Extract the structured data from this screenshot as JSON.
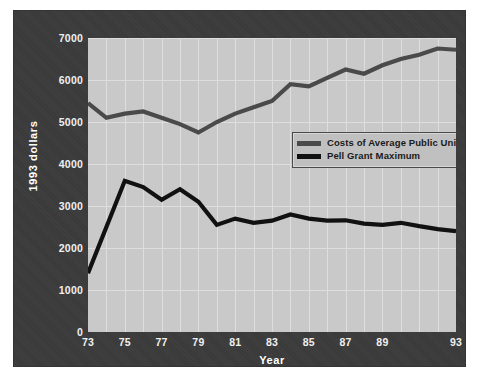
{
  "chart_data": {
    "type": "line",
    "title": "",
    "xlabel": "Year",
    "ylabel": "1993 dollars",
    "grid": true,
    "legend_position": "inside-upper-right",
    "xlim": [
      1973,
      1993
    ],
    "ylim": [
      0,
      7000
    ],
    "ytick_labels": [
      "7000",
      "6000",
      "5000",
      "4000",
      "3000",
      "2000",
      "1000",
      "0"
    ],
    "ytick_values": [
      7000,
      6000,
      5000,
      4000,
      3000,
      2000,
      1000,
      0
    ],
    "xtick_labels": [
      "73",
      "75",
      "77",
      "79",
      "81",
      "83",
      "85",
      "87",
      "89",
      "93"
    ],
    "xtick_values": [
      1973,
      1975,
      1977,
      1979,
      1981,
      1983,
      1985,
      1987,
      1989,
      1993
    ],
    "x": [
      1973,
      1974,
      1975,
      1976,
      1977,
      1978,
      1979,
      1980,
      1981,
      1982,
      1983,
      1984,
      1985,
      1986,
      1987,
      1988,
      1989,
      1990,
      1991,
      1992,
      1993
    ],
    "series": [
      {
        "name": "Costs of Average Public University",
        "color": "#4a4a4a",
        "values": [
          5450,
          5100,
          5200,
          5250,
          5100,
          4950,
          4750,
          5000,
          5200,
          5350,
          5500,
          5900,
          5850,
          6050,
          6250,
          6150,
          6350,
          6500,
          6600,
          6750,
          6720
        ]
      },
      {
        "name": "Pell Grant Maximum",
        "color": "#111111",
        "values": [
          1400,
          2500,
          3600,
          3450,
          3150,
          3400,
          3100,
          2550,
          2700,
          2600,
          2650,
          2800,
          2700,
          2650,
          2660,
          2580,
          2550,
          2600,
          2520,
          2450,
          2400
        ]
      }
    ]
  },
  "legend": {
    "items": [
      {
        "label": "Costs of Average Public University",
        "color": "#4a4a4a"
      },
      {
        "label": "Pell Grant Maximum",
        "color": "#111111"
      }
    ]
  },
  "axes": {
    "x_title": "Year",
    "y_title": "1993 dollars"
  }
}
